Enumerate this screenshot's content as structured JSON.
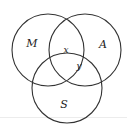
{
  "diagram": {
    "type": "venn-3-set",
    "sets": [
      {
        "name": "M",
        "label": "M",
        "cx": 48,
        "cy": 50,
        "r": 36,
        "label_x": 32,
        "label_y": 44
      },
      {
        "name": "A",
        "label": "A",
        "cx": 85,
        "cy": 50,
        "r": 36,
        "label_x": 103,
        "label_y": 45
      },
      {
        "name": "S",
        "label": "S",
        "cx": 67,
        "cy": 88,
        "r": 35,
        "label_x": 64,
        "label_y": 105
      }
    ],
    "region_labels": [
      {
        "name": "x",
        "label": "x",
        "region": "M ∩ A",
        "x": 66,
        "y": 50
      },
      {
        "name": "y",
        "label": "y",
        "region": "A ∩ S",
        "x": 79,
        "y": 66
      }
    ],
    "stroke_color": "#333333",
    "background": "#ffffff"
  }
}
